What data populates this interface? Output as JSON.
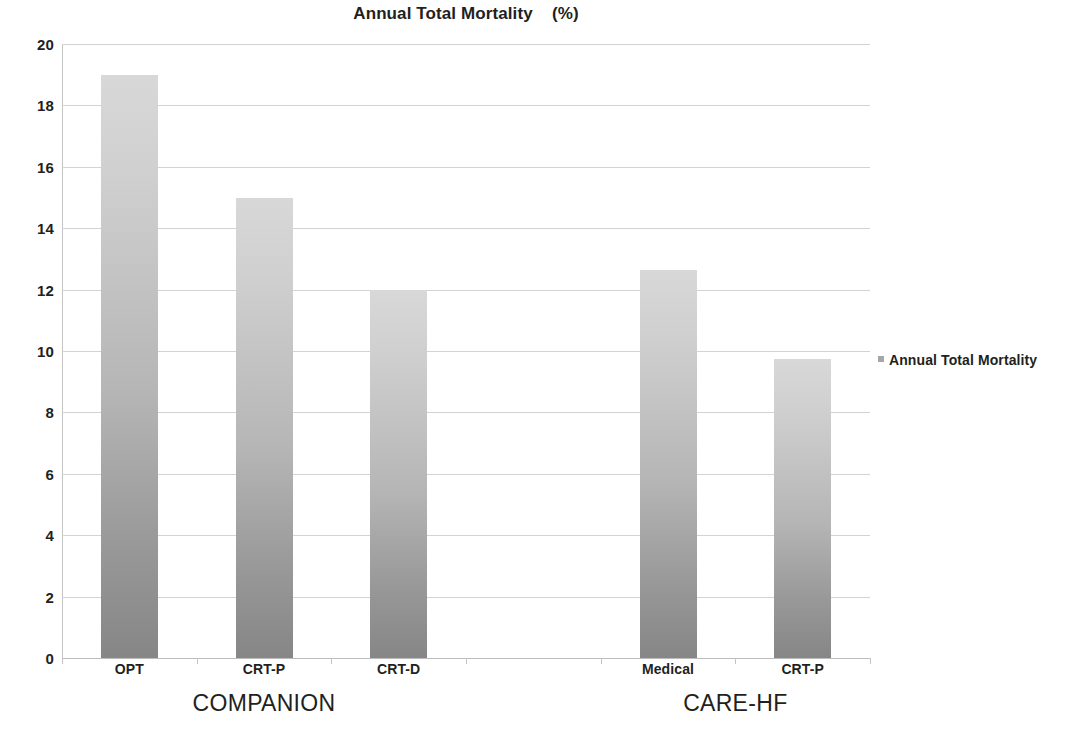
{
  "chart_data": {
    "type": "bar",
    "title": "Annual Total Mortality    (%)",
    "xlabel": "",
    "ylabel": "",
    "ylim": [
      0,
      20
    ],
    "ytick_step": 2,
    "grid": true,
    "legend_position": "right",
    "categories": [
      "OPT",
      "CRT-P",
      "CRT-D",
      "",
      "Medical",
      "CRT-P"
    ],
    "values": [
      19.0,
      15.0,
      12.0,
      null,
      12.65,
      9.75
    ],
    "series": [
      {
        "name": "Annual Total Mortality",
        "values": [
          19.0,
          15.0,
          12.0,
          null,
          12.65,
          9.75
        ]
      }
    ],
    "groups": [
      {
        "label": "COMPANION",
        "categories": [
          "OPT",
          "CRT-P",
          "CRT-D"
        ]
      },
      {
        "label": "CARE-HF",
        "categories": [
          "Medical",
          "CRT-P"
        ]
      }
    ],
    "y_tick_labels": [
      "20",
      "18",
      "16",
      "14",
      "12",
      "10",
      "8",
      "6",
      "4",
      "2",
      "0"
    ],
    "bar_color_top": "#d8d8d8",
    "bar_color_bottom": "#868686",
    "gridline_color": "#d3d3d3",
    "text_color": "#231f20"
  },
  "legend": {
    "entries": [
      {
        "label": "Annual Total Mortality",
        "color": "#a6a6a6",
        "marker": "square-marker"
      }
    ]
  },
  "axis": {
    "y_title": "",
    "x_title": ""
  }
}
